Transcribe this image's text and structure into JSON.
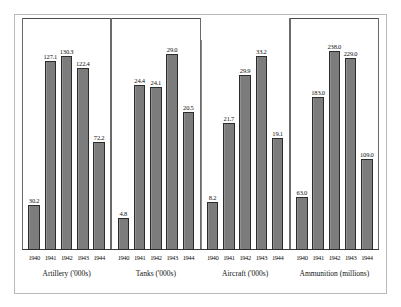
{
  "chart_data": {
    "type": "bar",
    "title": "",
    "categories": [
      "1940",
      "1941",
      "1942",
      "1943",
      "1944"
    ],
    "xlabel": "",
    "ylabel": "",
    "grid": false,
    "legend_position": "none",
    "panel_layout": "four side-by-side panels sharing a common vertical scale per panel",
    "panels": [
      {
        "name": "artillery",
        "title": "Artillery ('000s)",
        "categories": [
          "1940",
          "1941",
          "1942",
          "1943",
          "1944"
        ],
        "values": [
          30.2,
          127.1,
          130.3,
          122.4,
          72.2
        ],
        "value_labels": [
          "30.2",
          "127.1",
          "130.3",
          "122.4",
          "72.2"
        ],
        "ymax": 145
      },
      {
        "name": "tanks",
        "title": "Tanks ('000s)",
        "categories": [
          "1940",
          "1941",
          "1942",
          "1943",
          "1944"
        ],
        "values": [
          4.8,
          24.4,
          24.1,
          29.0,
          20.5
        ],
        "value_labels": [
          "4.8",
          "24.4",
          "24.1",
          "29.0",
          "20.5"
        ],
        "ymax": 32
      },
      {
        "name": "aircraft",
        "title": "Aircraft ('000s)",
        "categories": [
          "1940",
          "1941",
          "1942",
          "1943",
          "1944"
        ],
        "values": [
          8.2,
          21.7,
          29.9,
          33.2,
          19.1
        ],
        "value_labels": [
          "8.2",
          "21.7",
          "29.9",
          "33.2",
          "19.1"
        ],
        "ymax": 37
      },
      {
        "name": "ammunition",
        "title": "Ammunition (millions)",
        "categories": [
          "1940",
          "1941",
          "1942",
          "1943",
          "1944"
        ],
        "values": [
          63.0,
          183.0,
          238.0,
          229.0,
          109.0
        ],
        "value_labels": [
          "63.0",
          "183.0",
          "238.0",
          "229.0",
          "109.0"
        ],
        "ymax": 258
      }
    ],
    "colors": {
      "bar_fill": "#7c7c7c",
      "bar_stroke": "#2b2b2b",
      "axis": "#3a3a3a",
      "frame": "#b9b9b9",
      "text": "#111111",
      "background": "#ffffff"
    }
  }
}
